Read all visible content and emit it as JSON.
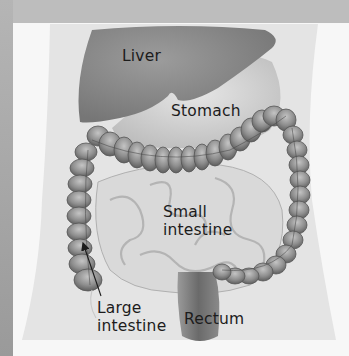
{
  "diagram": {
    "title": "",
    "style": "grayscale anatomical illustration",
    "colors": {
      "frame": "#a9a9a9",
      "panel": "#f7f7f7",
      "torso": "#e4e4e4",
      "liver": "#8a8a8a",
      "stomach": "#d2d2d2",
      "large_intestine": "#8f8f8f",
      "small_intestine": "#d9d9d9",
      "rectum": "#7a7a7a",
      "label_text": "#1c1c1c"
    },
    "labels": {
      "liver": "Liver",
      "stomach": "Stomach",
      "small_intestine_line1": "Small",
      "small_intestine_line2": "intestine",
      "large_intestine_line1": "Large",
      "large_intestine_line2": "intestine",
      "rectum": "Rectum"
    },
    "arrows": [
      {
        "from": "large-intestine-label",
        "to": "ascending-colon",
        "direction": "up-left"
      }
    ]
  }
}
